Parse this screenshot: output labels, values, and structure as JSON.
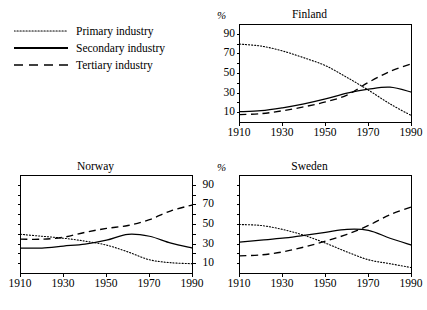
{
  "legend": {
    "items": [
      {
        "label": "Primary industry",
        "style": "dotted",
        "name": "primary"
      },
      {
        "label": "Secondary industry",
        "style": "solid",
        "name": "secondary"
      },
      {
        "label": "Tertiary industry",
        "style": "dashed",
        "name": "tertiary"
      }
    ]
  },
  "axis_unit": "%",
  "chart_data": [
    {
      "type": "line",
      "title": "Finland",
      "xlabel": "",
      "ylabel": "%",
      "x": [
        1910,
        1920,
        1930,
        1940,
        1950,
        1960,
        1970,
        1980,
        1990
      ],
      "xlim": [
        1910,
        1990
      ],
      "ylim": [
        0,
        100
      ],
      "xticks": [
        1910,
        1930,
        1950,
        1970,
        1990
      ],
      "yticks": [
        10,
        30,
        50,
        70,
        90
      ],
      "ytick_labels": [
        "10",
        "30",
        "50",
        "70",
        "90"
      ],
      "grid": false,
      "legend_position": "external-top-left",
      "series": [
        {
          "name": "Primary industry",
          "style": "dotted",
          "values": [
            80,
            78,
            73,
            66,
            58,
            46,
            33,
            19,
            7
          ]
        },
        {
          "name": "Secondary industry",
          "style": "solid",
          "values": [
            11,
            12,
            15,
            19,
            24,
            30,
            34,
            36,
            31
          ]
        },
        {
          "name": "Tertiary industry",
          "style": "dashed",
          "values": [
            8,
            9,
            12,
            16,
            21,
            28,
            41,
            52,
            60
          ]
        }
      ]
    },
    {
      "type": "line",
      "title": "Norway",
      "xlabel": "",
      "ylabel": "%",
      "x": [
        1910,
        1920,
        1930,
        1940,
        1950,
        1960,
        1970,
        1980,
        1990
      ],
      "xlim": [
        1910,
        1990
      ],
      "ylim": [
        0,
        100
      ],
      "xticks": [
        1910,
        1930,
        1950,
        1970,
        1990
      ],
      "yticks": [
        10,
        30,
        50,
        70,
        90
      ],
      "ytick_labels": [
        "10",
        "30",
        "50",
        "70",
        "90"
      ],
      "grid": false,
      "legend_position": "external-top-left",
      "series": [
        {
          "name": "Primary industry",
          "style": "dotted",
          "values": [
            40,
            38,
            36,
            33,
            29,
            22,
            14,
            11,
            10
          ]
        },
        {
          "name": "Secondary industry",
          "style": "solid",
          "values": [
            26,
            26,
            28,
            30,
            34,
            40,
            38,
            31,
            26
          ]
        },
        {
          "name": "Tertiary industry",
          "style": "dashed",
          "values": [
            35,
            35,
            37,
            42,
            46,
            49,
            55,
            64,
            70
          ]
        }
      ]
    },
    {
      "type": "line",
      "title": "Sweden",
      "xlabel": "",
      "ylabel": "%",
      "x": [
        1910,
        1920,
        1930,
        1940,
        1950,
        1960,
        1970,
        1980,
        1990
      ],
      "xlim": [
        1910,
        1990
      ],
      "ylim": [
        0,
        100
      ],
      "xticks": [
        1910,
        1930,
        1950,
        1970,
        1990
      ],
      "yticks": [
        10,
        30,
        50,
        70,
        90
      ],
      "ytick_labels": [
        "10",
        "30",
        "50",
        "70",
        "90"
      ],
      "grid": false,
      "legend_position": "external-top-left",
      "series": [
        {
          "name": "Primary industry",
          "style": "dotted",
          "values": [
            50,
            49,
            45,
            39,
            31,
            22,
            14,
            10,
            6
          ]
        },
        {
          "name": "Secondary industry",
          "style": "solid",
          "values": [
            32,
            34,
            36,
            39,
            42,
            45,
            44,
            36,
            29
          ]
        },
        {
          "name": "Tertiary industry",
          "style": "dashed",
          "values": [
            18,
            19,
            22,
            27,
            33,
            40,
            49,
            60,
            68
          ]
        }
      ]
    }
  ]
}
